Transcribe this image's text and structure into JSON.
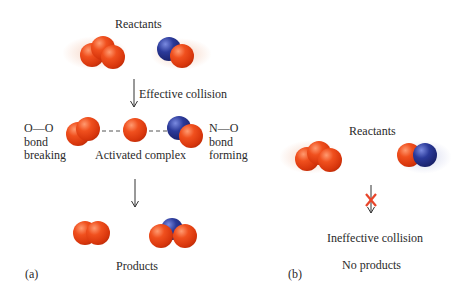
{
  "panel_a": {
    "reactants_label": "Reactants",
    "arrow1_label": "Effective collision",
    "left_bond": {
      "formula": "O—O",
      "line1": "bond",
      "line2": "breaking"
    },
    "right_bond": {
      "formula": "N—O",
      "line1": "bond",
      "line2": "forming"
    },
    "complex_label": "Activated complex",
    "products_label": "Products",
    "panel_letter": "(a)"
  },
  "panel_b": {
    "reactants_label": "Reactants",
    "collision_label": "Ineffective collision",
    "result_label": "No products",
    "panel_letter": "(b)",
    "x_color": "#e8452a"
  },
  "colors": {
    "oxygen": "#e0401a",
    "nitrogen": "#24307e"
  }
}
